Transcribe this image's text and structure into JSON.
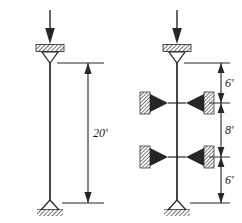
{
  "figure": {
    "ink_color": "#262626",
    "hatch_color": "#4d4d4d",
    "background_color": "#ffffff"
  },
  "columns": [
    {
      "id": "unbraced-column",
      "label": "Unbraced column",
      "load_arrow": "downward-axial-load",
      "top_support": "pin-support-with-cap-plate",
      "bottom_support": "pin-support-on-ground",
      "braces": [],
      "dimensions": [
        {
          "id": "dim-20",
          "value": "20'",
          "segment": "full-height"
        }
      ]
    },
    {
      "id": "braced-column",
      "label": "Braced column",
      "load_arrow": "downward-axial-load",
      "top_support": "pin-support-with-cap-plate",
      "bottom_support": "pin-support-on-ground",
      "braces": [
        {
          "id": "brace-upper",
          "type": "lateral-brace"
        },
        {
          "id": "brace-lower",
          "type": "lateral-brace"
        }
      ],
      "dimensions": [
        {
          "id": "dim-6-top",
          "value": "6'",
          "segment": "top-to-upper-brace"
        },
        {
          "id": "dim-8-mid",
          "value": "8'",
          "segment": "upper-brace-to-lower-brace"
        },
        {
          "id": "dim-6-bottom",
          "value": "6'",
          "segment": "lower-brace-to-base"
        }
      ]
    }
  ],
  "icons": {
    "load_arrow": "arrow-down-icon",
    "pin_support": "triangle-pin-icon",
    "ground_hatch": "hatch-icon",
    "brace_block": "hatched-block-icon"
  }
}
